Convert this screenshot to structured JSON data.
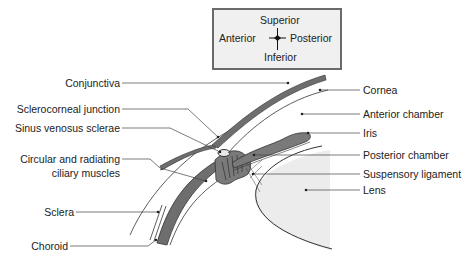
{
  "figure": {
    "colors": {
      "background": "#ffffff",
      "tissue_dark": "#6e6e6e",
      "tissue_mid": "#8c8c8c",
      "lens_fill": "#ececec",
      "line": "#333333",
      "compass_bg": "#f0f0f0",
      "compass_border": "#6a6a6a"
    }
  },
  "compass": {
    "top": "Superior",
    "bottom": "Inferior",
    "left": "Anterior",
    "right": "Posterior"
  },
  "labels_left": [
    {
      "id": "conjunctiva",
      "text": "Conjunctiva"
    },
    {
      "id": "sclerocorneal-junction",
      "text": "Sclerocorneal junction"
    },
    {
      "id": "sinus-venosus-sclerae",
      "text": "Sinus venosus sclerae"
    },
    {
      "id": "ciliary-muscles-1",
      "text": "Circular and radiating"
    },
    {
      "id": "ciliary-muscles-2",
      "text": "ciliary muscles"
    },
    {
      "id": "sclera",
      "text": "Sclera"
    },
    {
      "id": "choroid",
      "text": "Choroid"
    }
  ],
  "labels_right": [
    {
      "id": "cornea",
      "text": "Cornea"
    },
    {
      "id": "anterior-chamber",
      "text": "Anterior chamber"
    },
    {
      "id": "iris",
      "text": "Iris"
    },
    {
      "id": "posterior-chamber",
      "text": "Posterior chamber"
    },
    {
      "id": "suspensory-ligament",
      "text": "Suspensory ligament"
    },
    {
      "id": "lens",
      "text": "Lens"
    }
  ]
}
